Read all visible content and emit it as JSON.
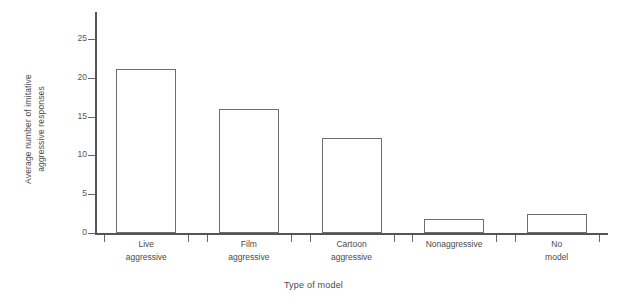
{
  "chart_data": {
    "type": "bar",
    "title": "",
    "subtitle": "",
    "categories": [
      "Live aggressive",
      "Film aggressive",
      "Cartoon aggressive",
      "Nonaggressive",
      "No model"
    ],
    "category_lines": [
      [
        "Live",
        "aggressive"
      ],
      [
        "Film",
        "aggressive"
      ],
      [
        "Cartoon",
        "aggressive"
      ],
      [
        "Nonaggressive"
      ],
      [
        "No",
        "model"
      ]
    ],
    "values": [
      21.2,
      16.0,
      12.3,
      1.8,
      2.5
    ],
    "xlabel": "Type of model",
    "ylabel": "Average number of imitative aggressive responses",
    "ylabel_lines": [
      "Average number of imitative",
      "aggressive responses"
    ],
    "ylim": [
      0,
      28.5
    ],
    "yticks": [
      0,
      5,
      10,
      15,
      20,
      25
    ],
    "ytick_labels": [
      "0",
      "5",
      "10",
      "15",
      "20",
      "25"
    ],
    "grid": false,
    "legend": null,
    "bar_fill": "#ffffff",
    "bar_stroke": "#6e6e6e",
    "axis_color": "#555555",
    "background": "#ffffff"
  }
}
